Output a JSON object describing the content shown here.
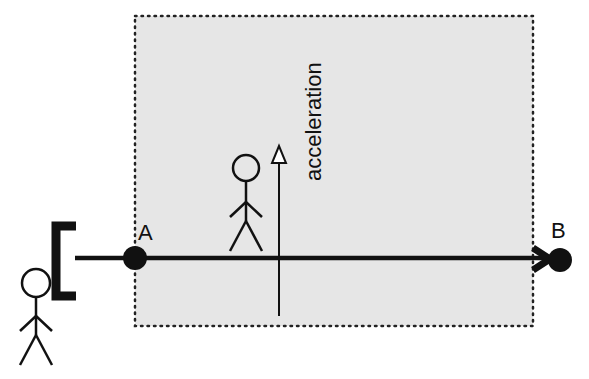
{
  "diagram": {
    "point_a_label": "A",
    "point_b_label": "B",
    "arrow_label": "acceleration",
    "colors": {
      "frame_fill": "#e6e6e6",
      "ink": "#111111",
      "background": "#ffffff"
    }
  }
}
